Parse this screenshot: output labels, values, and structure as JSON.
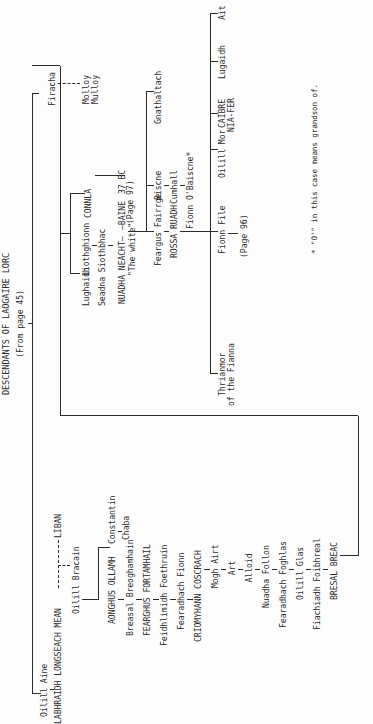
{
  "document": {
    "title": "DESCENDANTS OF LAOGAIRE LORC",
    "subtitle": "(From page 45)",
    "footnote": "* \"O'\" in this case means grandson of."
  },
  "people": {
    "oilill_aine": "Oilill Aine",
    "labhraidh": "LABHRAIDH LONGSEACH MEAN",
    "liban": "LIBAN",
    "oilill_bracain": "Oilill Bracain",
    "aonghus_ollamh": "AONGHUS OLLAMH",
    "constantin": "Constantin",
    "chaba": "Chaba",
    "breasal_breoghamhain": "Breasal Breoghamhain",
    "fearghus_fortamhail": "FEARGHUS FORTAMHAIL",
    "feidhlimidh_foethruin": "Feidhlimidh Foethruin",
    "fearadhach_fionn": "Fearadhach Fionn",
    "criomthann_coscrach": "CRIOMYHANN COSCRACH",
    "mogh_airt": "Mogh Airt",
    "art": "Art",
    "alloid": "Alloid",
    "nuadha_follon": "Nuadha Follon",
    "fearadhach_foghlas": "Fearadhach Foghlas",
    "oilill_glas": "Oilill Glas",
    "fiachiadh_foibhreal": "Fiachiadh Foibhreal",
    "bresal_breac": "BRESAL BREAC",
    "firacha": "Firacha",
    "molloy_1": "Molloy",
    "molloy_2": "Mulloy",
    "connla": "CONNLA",
    "page_97": "(Page 97)",
    "lughaidh": "Lughaidh",
    "liothghionn": "Liothghionn",
    "seadna_siothbhac": "Seadna Siothbhac",
    "nuadha_neacht": "NUADHA NEACHT—",
    "nuadha_epithet": "\"The white\"",
    "baine": "—BAINE",
    "baine_date": "37 BC",
    "feargus_fairrge": "Feargus Fairrge",
    "rossa_ruadh": "ROSSA RUADH",
    "biscne": "Biscne",
    "cumhall": "Cumhall",
    "fionn_obaiscne": "Fionn O'Baiscne*",
    "gnathaltach": "Gnathaltach",
    "fionn_file": "Fionn File",
    "page_96": "(Page 96)",
    "thrianmor_1": "Thrianmor",
    "thrianmor_2": "of the Fianna",
    "oilill_mor": "Oilill Mor",
    "caibre_1": "CAIBRE",
    "caibre_2": "NIA-FER",
    "lugaidh": "Lugaidh",
    "ait": "Ait"
  }
}
